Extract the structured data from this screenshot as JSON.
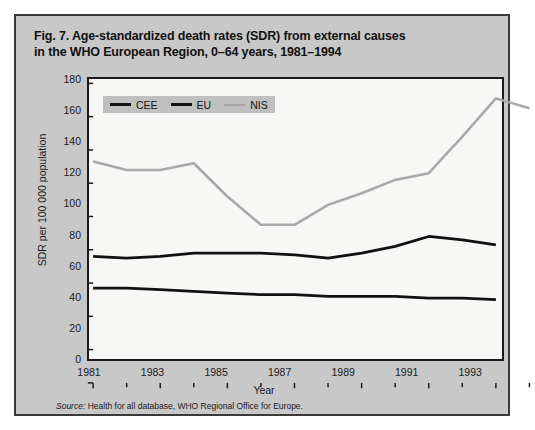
{
  "figure": {
    "title_line_1": "Fig. 7. Age-standardized death rates (SDR) from external causes",
    "title_line_2": "in the WHO European Region, 0–64 years, 1981–1994",
    "source_label": "Source:",
    "source_text": " Health for all database, WHO Regional Office for Europe."
  },
  "chart_data": {
    "type": "line",
    "title": "Fig. 7. Age-standardized death rates (SDR) from external causes in the WHO European Region, 0–64 years, 1981–1994",
    "xlabel": "Year",
    "ylabel": "SDR per 100 000 population",
    "x": [
      1981,
      1982,
      1983,
      1984,
      1985,
      1986,
      1987,
      1988,
      1989,
      1990,
      1991,
      1992,
      1993
    ],
    "xlim": [
      1981,
      1994
    ],
    "ylim": [
      0,
      180
    ],
    "xticks": [
      1981,
      1983,
      1985,
      1987,
      1989,
      1991,
      1993
    ],
    "xtick_labels": [
      "1981",
      "1983",
      "1985",
      "1987",
      "1989",
      "1991",
      "1993"
    ],
    "yticks": [
      0,
      20,
      40,
      60,
      80,
      100,
      120,
      140,
      160,
      180
    ],
    "ytick_labels": [
      "0",
      "20",
      "40",
      "60",
      "80",
      "100",
      "120",
      "140",
      "160",
      "180"
    ],
    "xminor_step": 1,
    "grid": false,
    "legend_position": "top-left",
    "series": [
      {
        "name": "CEE",
        "color": "#111111",
        "width": 2.6,
        "values": [
          76,
          75,
          76,
          78,
          78,
          78,
          77,
          75,
          78,
          82,
          88,
          86,
          83
        ]
      },
      {
        "name": "EU",
        "color": "#111111",
        "width": 2.6,
        "values": [
          57,
          57,
          56,
          55,
          54,
          53,
          53,
          52,
          52,
          52,
          51,
          51,
          50
        ]
      },
      {
        "name": "NIS",
        "color": "#a8a8a8",
        "width": 2.4,
        "values": [
          133,
          128,
          128,
          132,
          112,
          95,
          95,
          107,
          114,
          122,
          126,
          148,
          171
        ]
      }
    ],
    "series_extra_point": {
      "note": "NIS has a final point at 1994",
      "NIS_1994": 165
    }
  },
  "legend": {
    "items": [
      {
        "label": "CEE",
        "style": "thick",
        "icon": "line-swatch-icon"
      },
      {
        "label": "EU",
        "style": "thick",
        "icon": "line-swatch-icon"
      },
      {
        "label": "NIS",
        "style": "thin",
        "icon": "line-swatch-icon"
      }
    ]
  },
  "colors": {
    "panel_background": "#c8c8c8",
    "plot_background": "#f7f7f5",
    "frame": "#1a1a1a",
    "dark_series": "#111111",
    "light_series": "#a8a8a8"
  }
}
